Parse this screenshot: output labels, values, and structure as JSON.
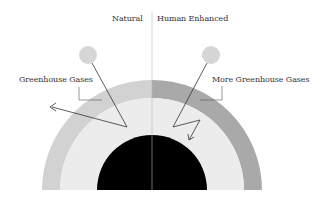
{
  "diagram": {
    "header": {
      "left_label": "Natural",
      "right_label": "Human Enhanced"
    },
    "labels": {
      "left_gas": "Greenhouse Gases",
      "right_gas": "More Greenhouse Gases"
    },
    "colors": {
      "background": "#ffffff",
      "left_outer_ring": "#d2d2d2",
      "right_outer_ring": "#a9a9a9",
      "inner_ring": "#ececec",
      "core": "#000000",
      "sun": "#d6d6d6",
      "divider": "#bbbbbb",
      "ray": "#333333"
    }
  }
}
